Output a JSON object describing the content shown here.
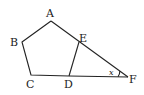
{
  "diagram": {
    "type": "geometry",
    "points": {
      "A": {
        "label": "A",
        "x": 51,
        "y": 21
      },
      "B": {
        "label": "B",
        "x": 22,
        "y": 42
      },
      "C": {
        "label": "C",
        "x": 31,
        "y": 75
      },
      "D": {
        "label": "D",
        "x": 69,
        "y": 76
      },
      "E": {
        "label": "E",
        "x": 79,
        "y": 42
      },
      "F": {
        "label": "F",
        "x": 128,
        "y": 77
      }
    },
    "angle_label": "x",
    "colors": {
      "stroke": "#222222",
      "background": "#ffffff"
    }
  }
}
